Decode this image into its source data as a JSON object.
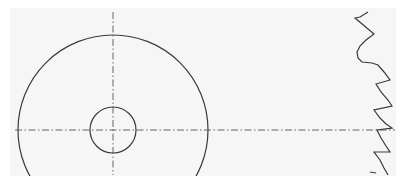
{
  "drawing": {
    "type": "technical-drawing",
    "subject": "gear / sprocket front view with partial tooth profile",
    "colors": {
      "background": "#ffffff",
      "sheet": "#f6f6f6",
      "outline": "#3a3a3a",
      "centerline": "#555555"
    },
    "center": {
      "x": 113,
      "y": 130
    },
    "outer_circle": {
      "cx": 113,
      "cy": 130,
      "r": 95
    },
    "inner_circle": {
      "cx": 113,
      "cy": 130,
      "r": 23
    },
    "vertical_centerline": {
      "x": 113,
      "y1": 12,
      "y2": 175
    },
    "horizontal_centerline": {
      "y": 130,
      "x1": 15,
      "x2": 395
    },
    "tooth_profile": {
      "points": "368,12 360,17 355,18 374,34 366,40 360,46 357,52 358,58 362,62 372,63 378,65 384,72 390,80 376,84 381,92 388,100 392,106 374,110 380,118 386,124 392,128 377,130 381,138 386,146 390,152 374,152 380,160 384,168 388,175",
      "end_tick": "370,172 376,173"
    }
  }
}
